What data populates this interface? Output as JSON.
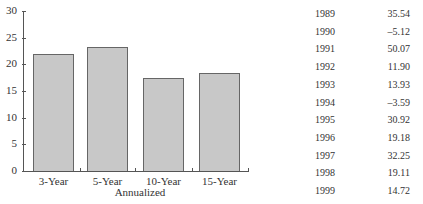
{
  "chart_data": {
    "type": "bar",
    "title": "",
    "xlabel": "Annualized",
    "ylabel": "",
    "ylim": [
      0,
      30
    ],
    "yticks": [
      0,
      5,
      10,
      15,
      20,
      25,
      30
    ],
    "categories": [
      "3-Year",
      "5-Year",
      "10-Year",
      "15-Year"
    ],
    "values": [
      21.9,
      23.2,
      17.4,
      18.4
    ],
    "grid": false,
    "legend": null
  },
  "table": {
    "rows": [
      {
        "year": "1989",
        "value": "35.54"
      },
      {
        "year": "1990",
        "value": "–5.12"
      },
      {
        "year": "1991",
        "value": "50.07"
      },
      {
        "year": "1992",
        "value": "11.90"
      },
      {
        "year": "1993",
        "value": "13.93"
      },
      {
        "year": "1994",
        "value": "–3.59"
      },
      {
        "year": "1995",
        "value": "30.92"
      },
      {
        "year": "1996",
        "value": "19.18"
      },
      {
        "year": "1997",
        "value": "32.25"
      },
      {
        "year": "1998",
        "value": "19.11"
      },
      {
        "year": "1999",
        "value": "14.72"
      }
    ]
  }
}
